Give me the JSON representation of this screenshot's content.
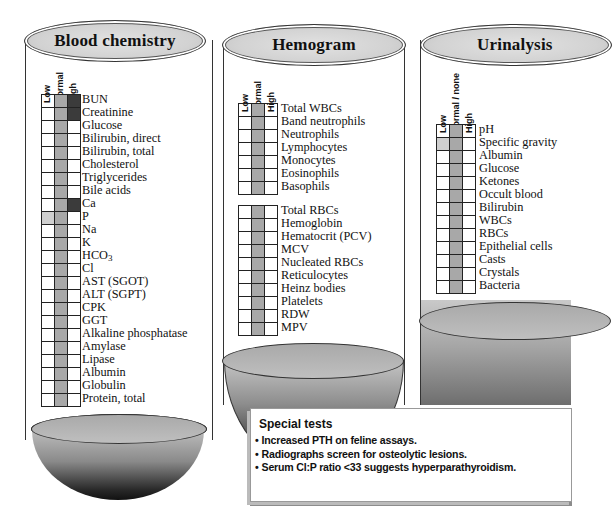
{
  "tubes": {
    "blood_chemistry": {
      "title": "Blood chemistry",
      "columns": [
        "Low",
        "Normal",
        "High"
      ],
      "rows": [
        {
          "label": "BUN",
          "low": false,
          "normal": true,
          "high": true
        },
        {
          "label": "Creatinine",
          "low": false,
          "normal": true,
          "high": true
        },
        {
          "label": "Glucose",
          "low": false,
          "normal": true,
          "high": false
        },
        {
          "label": "Bilirubin, direct",
          "low": false,
          "normal": true,
          "high": false
        },
        {
          "label": "Bilirubin, total",
          "low": false,
          "normal": true,
          "high": false
        },
        {
          "label": "Cholesterol",
          "low": false,
          "normal": true,
          "high": false
        },
        {
          "label": "Triglycerides",
          "low": false,
          "normal": true,
          "high": false
        },
        {
          "label": "Bile acids",
          "low": false,
          "normal": true,
          "high": false
        },
        {
          "label": "Ca",
          "low": false,
          "normal": true,
          "high": true
        },
        {
          "label": "P",
          "low": true,
          "normal": true,
          "high": false
        },
        {
          "label": "Na",
          "low": false,
          "normal": true,
          "high": false
        },
        {
          "label": "K",
          "low": false,
          "normal": true,
          "high": false
        },
        {
          "label": "HCO3",
          "low": false,
          "normal": true,
          "high": false
        },
        {
          "label": "Cl",
          "low": false,
          "normal": true,
          "high": false
        },
        {
          "label": "AST (SGOT)",
          "low": false,
          "normal": true,
          "high": false
        },
        {
          "label": "ALT (SGPT)",
          "low": false,
          "normal": true,
          "high": false
        },
        {
          "label": "CPK",
          "low": false,
          "normal": true,
          "high": false
        },
        {
          "label": "GGT",
          "low": false,
          "normal": true,
          "high": false
        },
        {
          "label": "Alkaline phosphatase",
          "low": false,
          "normal": true,
          "high": false
        },
        {
          "label": "Amylase",
          "low": false,
          "normal": true,
          "high": false
        },
        {
          "label": "Lipase",
          "low": false,
          "normal": true,
          "high": false
        },
        {
          "label": "Albumin",
          "low": false,
          "normal": true,
          "high": false
        },
        {
          "label": "Globulin",
          "low": false,
          "normal": true,
          "high": false
        },
        {
          "label": "Protein, total",
          "low": false,
          "normal": true,
          "high": false
        }
      ]
    },
    "hemogram": {
      "title": "Hemogram",
      "columns": [
        "Low",
        "Normal",
        "High"
      ],
      "wbc_rows": [
        {
          "label": "Total WBCs",
          "low": false,
          "normal": true,
          "high": false
        },
        {
          "label": "Band neutrophils",
          "low": false,
          "normal": true,
          "high": false
        },
        {
          "label": "Neutrophils",
          "low": false,
          "normal": true,
          "high": false
        },
        {
          "label": "Lymphocytes",
          "low": false,
          "normal": true,
          "high": false
        },
        {
          "label": "Monocytes",
          "low": false,
          "normal": true,
          "high": false
        },
        {
          "label": "Eosinophils",
          "low": false,
          "normal": true,
          "high": false
        },
        {
          "label": "Basophils",
          "low": false,
          "normal": true,
          "high": false
        }
      ],
      "rbc_rows": [
        {
          "label": "Total RBCs",
          "low": false,
          "normal": true,
          "high": false
        },
        {
          "label": "Hemoglobin",
          "low": false,
          "normal": true,
          "high": false
        },
        {
          "label": "Hematocrit (PCV)",
          "low": false,
          "normal": true,
          "high": false
        },
        {
          "label": "MCV",
          "low": false,
          "normal": true,
          "high": false
        },
        {
          "label": "Nucleated RBCs",
          "low": false,
          "normal": true,
          "high": false
        },
        {
          "label": "Reticulocytes",
          "low": false,
          "normal": true,
          "high": false
        },
        {
          "label": "Heinz bodies",
          "low": false,
          "normal": true,
          "high": false
        },
        {
          "label": "Platelets",
          "low": false,
          "normal": true,
          "high": false
        },
        {
          "label": "RDW",
          "low": false,
          "normal": true,
          "high": false
        },
        {
          "label": "MPV",
          "low": false,
          "normal": true,
          "high": false
        }
      ]
    },
    "urinalysis": {
      "title": "Urinalysis",
      "columns": [
        "Low",
        "Normal / none",
        "High"
      ],
      "rows": [
        {
          "label": "pH",
          "low": false,
          "normal": true,
          "high": false
        },
        {
          "label": "Specific gravity",
          "low": true,
          "normal": true,
          "high": false
        },
        {
          "label": "Albumin",
          "low": false,
          "normal": true,
          "high": false
        },
        {
          "label": "Glucose",
          "low": false,
          "normal": true,
          "high": false
        },
        {
          "label": "Ketones",
          "low": false,
          "normal": true,
          "high": false
        },
        {
          "label": "Occult blood",
          "low": false,
          "normal": true,
          "high": false
        },
        {
          "label": "Bilirubin",
          "low": false,
          "normal": true,
          "high": false
        },
        {
          "label": "WBCs",
          "low": false,
          "normal": true,
          "high": false
        },
        {
          "label": "RBCs",
          "low": false,
          "normal": true,
          "high": false
        },
        {
          "label": "Epithelial cells",
          "low": false,
          "normal": true,
          "high": false
        },
        {
          "label": "Casts",
          "low": false,
          "normal": true,
          "high": false
        },
        {
          "label": "Crystals",
          "low": false,
          "normal": true,
          "high": false
        },
        {
          "label": "Bacteria",
          "low": false,
          "normal": true,
          "high": false
        }
      ]
    }
  },
  "special_tests": {
    "title": "Special tests",
    "items": [
      "Increased PTH on feline assays.",
      "Radiographs screen for osteolytic lesions.",
      "Serum Cl:P ratio <33 suggests hyperparathyroidism."
    ]
  },
  "colors": {
    "normal_shade": "#a8a8a8",
    "high_shade": "#3b3b3b",
    "low_shade": "#cfcfcf",
    "cap_fill": "#d2d2d2"
  }
}
